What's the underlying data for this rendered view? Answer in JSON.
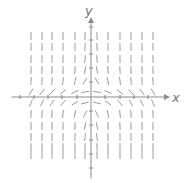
{
  "figure": {
    "type": "slope-field",
    "x_label": "x",
    "y_label": "y",
    "axis_color": "#8a8a8a",
    "segment_color": "#8f8f8f",
    "origin_px": [
      91,
      97
    ],
    "x_ticks_px": [
      20,
      34,
      48,
      62,
      77,
      105,
      120,
      134,
      148
    ],
    "y_ticks_px": [
      27,
      40,
      54,
      68,
      82,
      111,
      125,
      140,
      154,
      168
    ],
    "columns_px": [
      31,
      42,
      52,
      63,
      75,
      85,
      97,
      108,
      120,
      131,
      142,
      153
    ],
    "rows_px": [
      36,
      47,
      59,
      70,
      81,
      92,
      103,
      114,
      126,
      137,
      147,
      155
    ],
    "slope_rule": "slope proportional to -x*y^2 (steep far from x-axis, flat near it; positive left of y-axis, negative right)"
  }
}
